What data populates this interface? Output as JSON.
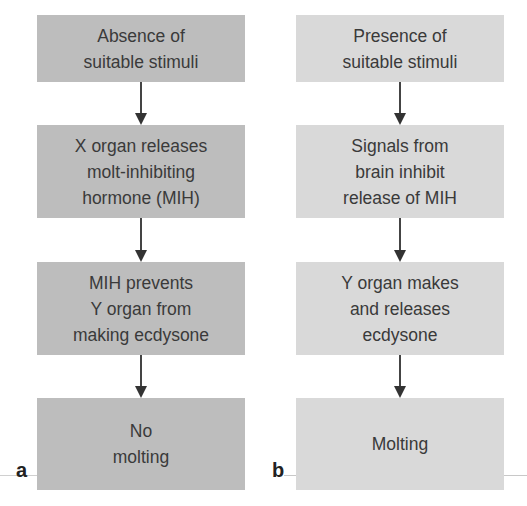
{
  "panels": [
    {
      "label": "a",
      "steps": [
        "Absence of\nsuitable stimuli",
        "X organ releases\nmolt-inhibiting\nhormone (MIH)",
        "MIH prevents\nY organ from\nmaking ecdysone",
        "No\nmolting"
      ],
      "box_color": "#bdbdbd"
    },
    {
      "label": "b",
      "steps": [
        "Presence of\nsuitable stimuli",
        "Signals from\nbrain inhibit\nrelease of MIH",
        "Y organ makes\nand releases\necdysone",
        "Molting"
      ],
      "box_color": "#d9d9d9"
    }
  ],
  "colors": {
    "text": "#3a3a3a",
    "arrow": "#444444",
    "background": "#ffffff"
  }
}
